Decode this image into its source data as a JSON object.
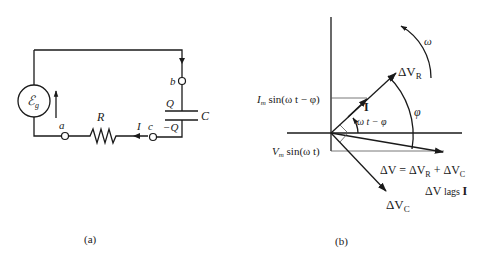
{
  "figure": {
    "panels": [
      {
        "id": "a",
        "caption": "(a)",
        "title": "Series RC circuit",
        "components": {
          "source_label": "ℰ",
          "source_subscript": "g",
          "resistor_label": "R",
          "capacitor_label": "C",
          "capacitor_top_charge": "Q",
          "capacitor_bottom_charge": "−Q",
          "current_label": "I"
        },
        "nodes": [
          "a",
          "b",
          "c"
        ]
      },
      {
        "id": "b",
        "caption": "(b)",
        "title": "Phasor diagram",
        "labels": {
          "omega": "ω",
          "phi": "φ",
          "delta_vr": "ΔV",
          "delta_vr_sub": "R",
          "delta_vc": "ΔV",
          "delta_vc_sub": "C",
          "current_phasor": "I",
          "angle_label": "ω t − φ",
          "projection_current": "I",
          "projection_current_sub": "m",
          "projection_current_rest": " sin(ω t − φ)",
          "projection_voltage": "V",
          "projection_voltage_sub": "m",
          "projection_voltage_rest": " sin(ω t)",
          "sum_eq_part1": "ΔV = ΔV",
          "sum_eq_sub1": "R",
          "sum_eq_part2": " + ΔV",
          "sum_eq_sub2": "C",
          "lag_text_dv": "ΔV",
          "lag_text_mid": " lags ",
          "lag_text_i": "I"
        }
      }
    ]
  }
}
